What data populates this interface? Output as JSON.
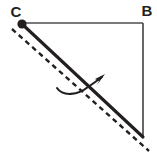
{
  "figure": {
    "type": "geometry-diagram",
    "background_color": "#ffffff",
    "width": 157,
    "height": 153,
    "labels": [
      {
        "id": "C",
        "text": "C",
        "x": 16,
        "y": 17,
        "anchor": "middle"
      },
      {
        "id": "B",
        "text": "B",
        "x": 147,
        "y": 16,
        "anchor": "middle"
      }
    ],
    "vertices": [
      {
        "id": "C",
        "x": 22,
        "y": 24,
        "marker": "filled-dot",
        "radius": 4.6,
        "color": "#231f20"
      },
      {
        "id": "B",
        "x": 143,
        "y": 23,
        "marker": "none"
      },
      {
        "id": "A",
        "x": 143,
        "y": 137,
        "marker": "none"
      }
    ],
    "edges": [
      {
        "id": "top-edge-CB",
        "from": "C",
        "to": "B",
        "style": "solid",
        "x1": 22,
        "y1": 23,
        "x2": 143,
        "y2": 23,
        "color": "#4d4d4f",
        "width": 1.7
      },
      {
        "id": "right-edge-BA",
        "from": "B",
        "to": "A",
        "style": "solid",
        "x1": 143,
        "y1": 23,
        "x2": 143,
        "y2": 137,
        "color": "#4d4d4f",
        "width": 1.7
      },
      {
        "id": "hypotenuse-CA",
        "from": "C",
        "to": "A",
        "style": "solid-thick",
        "x1": 22,
        "y1": 24,
        "x2": 143,
        "y2": 137,
        "color": "#231f20",
        "width": 3.1
      },
      {
        "id": "dashed-image-segment",
        "from": "C-offset",
        "to": "beyond-A",
        "style": "dashed",
        "x1": 12,
        "y1": 29,
        "x2": 149,
        "y2": 151,
        "color": "#231f20",
        "width": 2.4,
        "dash_pattern": "5 4"
      }
    ],
    "rotation_arrow": {
      "id": "rotation-arrow",
      "style": "curved-arrow",
      "color": "#231f20",
      "width": 2.1,
      "path": "M 57 88 C 63 97 78 95 88 87 C 94 83 98 80 102 77",
      "arrowhead": {
        "x": 104,
        "y": 76,
        "angle_deg": -38,
        "size": 8
      },
      "direction": "counterclockwise-to-clockwise-sweep"
    },
    "colors": {
      "ink": "#231f20",
      "thin_line": "#4d4d4f",
      "background": "#ffffff"
    }
  }
}
